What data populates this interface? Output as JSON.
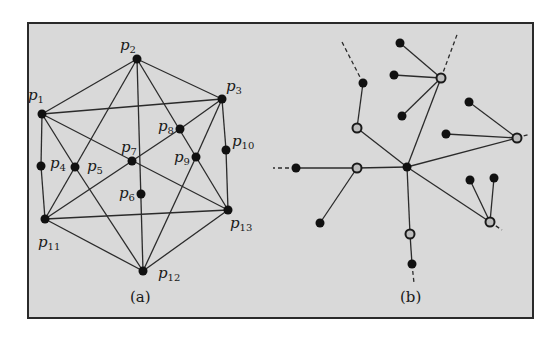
{
  "figure": {
    "panels": [
      {
        "id": "a",
        "caption": "(a)",
        "nodes": [
          {
            "id": "p1",
            "label": "p",
            "sub": "1",
            "x": 42,
            "y": 114,
            "lx": 28,
            "ly": 100
          },
          {
            "id": "p2",
            "label": "p",
            "sub": "2",
            "x": 137,
            "y": 59,
            "lx": 120,
            "ly": 50
          },
          {
            "id": "p3",
            "label": "p",
            "sub": "3",
            "x": 222,
            "y": 99,
            "lx": 226,
            "ly": 91
          },
          {
            "id": "p4",
            "label": "p",
            "sub": "4",
            "x": 41,
            "y": 166,
            "lx": 50,
            "ly": 168
          },
          {
            "id": "p5",
            "label": "p",
            "sub": "5",
            "x": 75,
            "y": 167,
            "lx": 87,
            "ly": 171
          },
          {
            "id": "p6",
            "label": "p",
            "sub": "6",
            "x": 141,
            "y": 194,
            "lx": 119,
            "ly": 198
          },
          {
            "id": "p7",
            "label": "p",
            "sub": "7",
            "x": 132,
            "y": 161,
            "lx": 121,
            "ly": 152
          },
          {
            "id": "p8",
            "label": "p",
            "sub": "8",
            "x": 180,
            "y": 129,
            "lx": 158,
            "ly": 131
          },
          {
            "id": "p9",
            "label": "p",
            "sub": "9",
            "x": 196,
            "y": 157,
            "lx": 174,
            "ly": 162
          },
          {
            "id": "p10",
            "label": "p",
            "sub": "10",
            "x": 226,
            "y": 150,
            "lx": 232,
            "ly": 146
          },
          {
            "id": "p11",
            "label": "p",
            "sub": "11",
            "x": 45,
            "y": 219,
            "lx": 38,
            "ly": 247
          },
          {
            "id": "p12",
            "label": "p",
            "sub": "12",
            "x": 143,
            "y": 271,
            "lx": 158,
            "ly": 278
          },
          {
            "id": "p13",
            "label": "p",
            "sub": "13",
            "x": 228,
            "y": 210,
            "lx": 230,
            "ly": 228
          }
        ],
        "edges": [
          [
            "p1",
            "p2"
          ],
          [
            "p2",
            "p3"
          ],
          [
            "p1",
            "p3"
          ],
          [
            "p1",
            "p4"
          ],
          [
            "p4",
            "p11"
          ],
          [
            "p1",
            "p5"
          ],
          [
            "p5",
            "p12"
          ],
          [
            "p1",
            "p13"
          ],
          [
            "p2",
            "p5"
          ],
          [
            "p2",
            "p12"
          ],
          [
            "p2",
            "p9"
          ],
          [
            "p3",
            "p8"
          ],
          [
            "p3",
            "p10"
          ],
          [
            "p10",
            "p13"
          ],
          [
            "p3",
            "p9"
          ],
          [
            "p9",
            "p13"
          ],
          [
            "p9",
            "p12"
          ],
          [
            "p8",
            "p7"
          ],
          [
            "p7",
            "p11"
          ],
          [
            "p5",
            "p11"
          ],
          [
            "p11",
            "p13"
          ],
          [
            "p11",
            "p12"
          ],
          [
            "p12",
            "p13"
          ]
        ]
      },
      {
        "id": "b",
        "caption": "(b)",
        "nodes": [
          {
            "id": "c",
            "type": "black",
            "x": 407,
            "y": 167
          },
          {
            "id": "h1",
            "type": "hollow",
            "x": 357,
            "y": 128
          },
          {
            "id": "h2",
            "type": "hollow",
            "x": 441,
            "y": 78
          },
          {
            "id": "h3",
            "type": "hollow",
            "x": 517,
            "y": 138
          },
          {
            "id": "h4",
            "type": "hollow",
            "x": 357,
            "y": 168
          },
          {
            "id": "h5",
            "type": "hollow",
            "x": 490,
            "y": 222
          },
          {
            "id": "h6",
            "type": "hollow",
            "x": 410,
            "y": 234
          },
          {
            "id": "b1",
            "type": "black",
            "x": 363,
            "y": 83
          },
          {
            "id": "b2",
            "type": "black",
            "x": 400,
            "y": 43
          },
          {
            "id": "b3",
            "type": "black",
            "x": 394,
            "y": 75
          },
          {
            "id": "b4",
            "type": "black",
            "x": 402,
            "y": 116
          },
          {
            "id": "b5",
            "type": "black",
            "x": 469,
            "y": 102
          },
          {
            "id": "b6",
            "type": "black",
            "x": 446,
            "y": 134
          },
          {
            "id": "b7",
            "type": "black",
            "x": 296,
            "y": 168
          },
          {
            "id": "b8",
            "type": "black",
            "x": 320,
            "y": 223
          },
          {
            "id": "b9",
            "type": "black",
            "x": 470,
            "y": 180
          },
          {
            "id": "b10",
            "type": "black",
            "x": 494,
            "y": 178
          },
          {
            "id": "b11",
            "type": "black",
            "x": 412,
            "y": 264
          }
        ],
        "edges": [
          [
            "c",
            "h1"
          ],
          [
            "h1",
            "b1"
          ],
          [
            "c",
            "h2"
          ],
          [
            "h2",
            "b2"
          ],
          [
            "h2",
            "b3"
          ],
          [
            "h2",
            "b4"
          ],
          [
            "c",
            "h3"
          ],
          [
            "h3",
            "b5"
          ],
          [
            "h3",
            "b6"
          ],
          [
            "c",
            "h4"
          ],
          [
            "h4",
            "b7"
          ],
          [
            "h4",
            "b8"
          ],
          [
            "c",
            "h5"
          ],
          [
            "h5",
            "b9"
          ],
          [
            "h5",
            "b10"
          ],
          [
            "c",
            "h6"
          ],
          [
            "h6",
            "b11"
          ]
        ],
        "dashed_stubs": [
          {
            "x1": 363,
            "y1": 83,
            "x2": 342,
            "y2": 42
          },
          {
            "x1": 441,
            "y1": 78,
            "x2": 458,
            "y2": 32
          },
          {
            "x1": 517,
            "y1": 138,
            "x2": 530,
            "y2": 134
          },
          {
            "x1": 296,
            "y1": 168,
            "x2": 273,
            "y2": 168
          },
          {
            "x1": 490,
            "y1": 222,
            "x2": 502,
            "y2": 230
          },
          {
            "x1": 412,
            "y1": 264,
            "x2": 414,
            "y2": 283
          }
        ]
      }
    ]
  }
}
